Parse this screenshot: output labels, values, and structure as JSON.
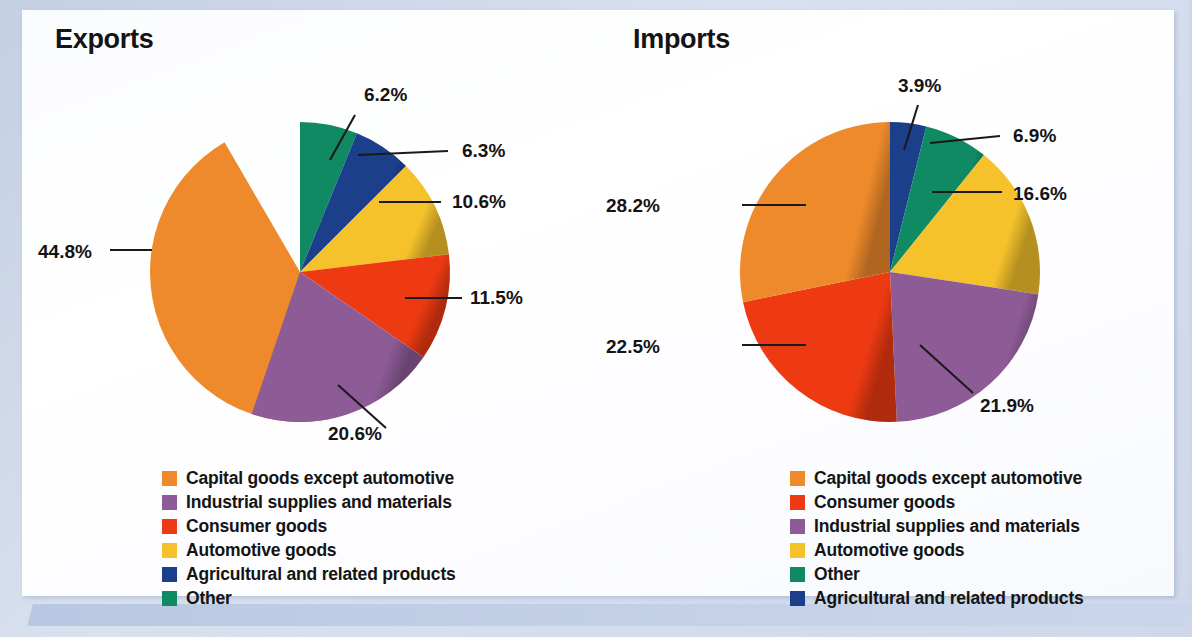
{
  "colors": {
    "capital_goods": "#EE8A2B",
    "industrial_supplies": "#8D5B96",
    "consumer_goods": "#EE3A12",
    "automotive_goods": "#F5C22B",
    "agricultural": "#1B3F8B",
    "other": "#108A63",
    "text": "#141414",
    "page_frame": "#c4d1e8",
    "sheet": "#ffffff"
  },
  "panels": {
    "exports": {
      "title": "Exports"
    },
    "imports": {
      "title": "Imports"
    }
  },
  "chart_data": [
    {
      "type": "pie",
      "title": "Exports",
      "categories": [
        "Capital goods except automotive",
        "Other",
        "Agricultural and related products",
        "Automotive goods",
        "Consumer goods",
        "Industrial supplies and materials"
      ],
      "values": [
        44.8,
        6.2,
        6.3,
        10.6,
        11.5,
        20.6
      ],
      "labels": [
        "44.8%",
        "6.2%",
        "6.3%",
        "10.6%",
        "11.5%",
        "20.6%"
      ],
      "colors": [
        "#EE8A2B",
        "#108A63",
        "#1B3F8B",
        "#F5C22B",
        "#EE3A12",
        "#8D5B96"
      ],
      "unit": "percent",
      "start_angle_deg": 0,
      "direction": "clockwise",
      "legend": {
        "position": "bottom",
        "entries": [
          {
            "label": "Capital goods except automotive",
            "color": "#EE8A2B"
          },
          {
            "label": "Industrial supplies and materials",
            "color": "#8D5B96"
          },
          {
            "label": "Consumer goods",
            "color": "#EE3A12"
          },
          {
            "label": "Automotive goods",
            "color": "#F5C22B"
          },
          {
            "label": "Agricultural and related products",
            "color": "#1B3F8B"
          },
          {
            "label": "Other",
            "color": "#108A63"
          }
        ]
      },
      "slices": [
        {
          "label": "44.8%",
          "value": 44.8,
          "color": "#EE8A2B",
          "start": 168.5,
          "sweep": 161.3,
          "label_x": 38,
          "label_y": 258,
          "line": "M 152 250 L 110 250"
        },
        {
          "label": "6.2%",
          "value": 6.2,
          "color": "#108A63",
          "start": 0,
          "sweep": 22.3,
          "label_x": 364,
          "label_y": 101,
          "line": "M 330 160 L 355 115"
        },
        {
          "label": "6.3%",
          "value": 6.3,
          "color": "#1B3F8B",
          "start": 22.3,
          "sweep": 22.7,
          "label_x": 462,
          "label_y": 157,
          "line": "M 358 155 L 448 151"
        },
        {
          "label": "10.6%",
          "value": 10.6,
          "color": "#F5C22B",
          "start": 45.0,
          "sweep": 38.2,
          "label_x": 452,
          "label_y": 208,
          "line": "M 379 202 L 441 202"
        },
        {
          "label": "11.5%",
          "value": 11.5,
          "color": "#EE3A12",
          "start": 83.2,
          "sweep": 41.4,
          "label_x": 470,
          "label_y": 304,
          "line": "M 405 298 L 462 298"
        },
        {
          "label": "20.6%",
          "value": 20.6,
          "color": "#8D5B96",
          "start": 124.6,
          "sweep": 74.2,
          "label_x": 328,
          "label_y": 440,
          "line": "M 338 385 L 386 428"
        }
      ]
    },
    {
      "type": "pie",
      "title": "Imports",
      "categories": [
        "Capital goods except automotive",
        "Agricultural and related products",
        "Other",
        "Automotive goods",
        "Industrial supplies and materials",
        "Consumer goods"
      ],
      "values": [
        28.2,
        3.9,
        6.9,
        16.6,
        21.9,
        22.5
      ],
      "labels": [
        "28.2%",
        "3.9%",
        "6.9%",
        "16.6%",
        "21.9%",
        "22.5%"
      ],
      "colors": [
        "#EE8A2B",
        "#1B3F8B",
        "#108A63",
        "#F5C22B",
        "#8D5B96",
        "#EE3A12"
      ],
      "unit": "percent",
      "start_angle_deg": 0,
      "direction": "clockwise",
      "legend": {
        "position": "bottom",
        "entries": [
          {
            "label": "Capital goods except automotive",
            "color": "#EE8A2B"
          },
          {
            "label": "Consumer goods",
            "color": "#EE3A12"
          },
          {
            "label": "Industrial supplies and materials",
            "color": "#8D5B96"
          },
          {
            "label": "Automotive goods",
            "color": "#F5C22B"
          },
          {
            "label": "Other",
            "color": "#108A63"
          },
          {
            "label": "Agricultural and related products",
            "color": "#1B3F8B"
          }
        ]
      },
      "slices": [
        {
          "label": "3.9%",
          "value": 3.9,
          "color": "#1B3F8B",
          "start": 0,
          "sweep": 14.0,
          "label_x": 340,
          "label_y": 92,
          "line": "M 346 150 L 360 105"
        },
        {
          "label": "6.9%",
          "value": 6.9,
          "color": "#108A63",
          "start": 14.0,
          "sweep": 24.8,
          "label_x": 455,
          "label_y": 142,
          "line": "M 372 143 L 442 136"
        },
        {
          "label": "16.6%",
          "value": 16.6,
          "color": "#F5C22B",
          "start": 38.8,
          "sweep": 59.8,
          "label_x": 455,
          "label_y": 200,
          "line": "M 374 192 L 444 192"
        },
        {
          "label": "21.9%",
          "value": 21.9,
          "color": "#8D5B96",
          "start": 98.6,
          "sweep": 78.8,
          "label_x": 422,
          "label_y": 412,
          "line": "M 362 345 L 415 393"
        },
        {
          "label": "22.5%",
          "value": 22.5,
          "color": "#EE3A12",
          "start": 177.4,
          "sweep": 81.0,
          "label_x": 48,
          "label_y": 353,
          "line": "M 248 345 L 184 345"
        },
        {
          "label": "28.2%",
          "value": 28.2,
          "color": "#EE8A2B",
          "start": 258.4,
          "sweep": 101.6,
          "label_x": 48,
          "label_y": 212,
          "line": "M 248 205 L 184 205"
        }
      ]
    }
  ]
}
